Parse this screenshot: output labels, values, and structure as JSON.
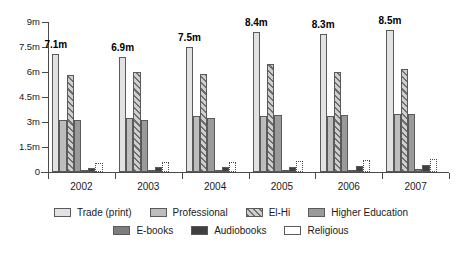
{
  "chart_data": {
    "type": "bar",
    "title": "",
    "subtitle": "",
    "xlabel": "",
    "ylabel": "",
    "grid": false,
    "legend_position": "bottom",
    "categories": [
      "2002",
      "2003",
      "2004",
      "2005",
      "2006",
      "2007"
    ],
    "ylim": [
      0,
      9
    ],
    "y_ticks": [
      0,
      1.5,
      3,
      4.5,
      6,
      7.5,
      9
    ],
    "y_tick_labels": [
      "0",
      "1.5m",
      "3m",
      "4.5m",
      "6m",
      "7.5m",
      "9m"
    ],
    "series": [
      {
        "name": "Trade (print)",
        "color": "#e2e2e2",
        "pattern": "solid",
        "values": [
          7.1,
          6.9,
          7.5,
          8.4,
          8.3,
          8.5
        ]
      },
      {
        "name": "Professional",
        "color": "#bdbdbd",
        "pattern": "solid",
        "values": [
          3.15,
          3.25,
          3.35,
          3.35,
          3.35,
          3.5
        ]
      },
      {
        "name": "El-Hi",
        "color": "#a8a8a8",
        "pattern": "diagonal-hatch",
        "values": [
          5.8,
          6.0,
          5.9,
          6.5,
          6.0,
          6.2
        ]
      },
      {
        "name": "Higher Education",
        "color": "#9a9a9a",
        "pattern": "solid",
        "values": [
          3.1,
          3.15,
          3.25,
          3.4,
          3.4,
          3.5
        ]
      },
      {
        "name": "E-books",
        "color": "#7d7d7d",
        "pattern": "solid",
        "values": [
          0.05,
          0.08,
          0.1,
          0.12,
          0.15,
          0.2
        ]
      },
      {
        "name": "Audiobooks",
        "color": "#3f3f3f",
        "pattern": "solid",
        "values": [
          0.25,
          0.28,
          0.3,
          0.32,
          0.35,
          0.4
        ]
      },
      {
        "name": "Religious",
        "color": "#ffffff",
        "pattern": "dotted-outline",
        "values": [
          0.55,
          0.6,
          0.62,
          0.68,
          0.72,
          0.8
        ]
      }
    ],
    "annotations": [
      {
        "category": "2002",
        "series": "Trade (print)",
        "text": "7.1m"
      },
      {
        "category": "2003",
        "series": "Trade (print)",
        "text": "6.9m"
      },
      {
        "category": "2004",
        "series": "Trade (print)",
        "text": "7.5m"
      },
      {
        "category": "2005",
        "series": "Trade (print)",
        "text": "8.4m"
      },
      {
        "category": "2006",
        "series": "Trade (print)",
        "text": "8.3m"
      },
      {
        "category": "2007",
        "series": "Trade (print)",
        "text": "8.5m"
      }
    ]
  },
  "legend": {
    "items": [
      {
        "label": "Trade (print)",
        "swatch": "trade-swatch"
      },
      {
        "label": "Professional",
        "swatch": "professional-swatch"
      },
      {
        "label": "El-Hi",
        "swatch": "elhi-swatch"
      },
      {
        "label": "Higher Education",
        "swatch": "higher-education-swatch"
      },
      {
        "label": "E-books",
        "swatch": "ebooks-swatch"
      },
      {
        "label": "Audiobooks",
        "swatch": "audiobooks-swatch"
      },
      {
        "label": "Religious",
        "swatch": "religious-swatch"
      }
    ]
  }
}
